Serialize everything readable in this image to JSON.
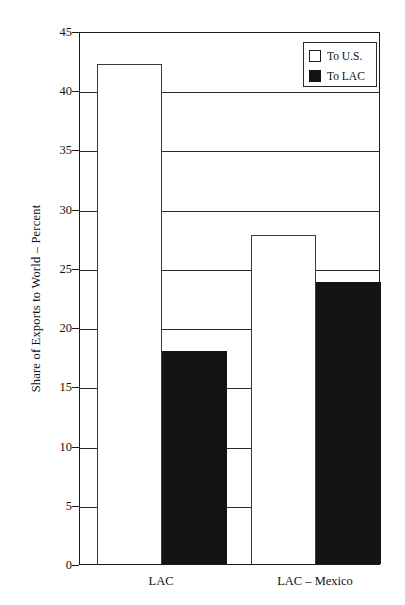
{
  "chart_data": {
    "type": "bar",
    "title": "",
    "xlabel": "",
    "ylabel": "Share of Exports to World – Percent",
    "categories": [
      "LAC",
      "LAC – Mexico"
    ],
    "series": [
      {
        "name": "To U.S.",
        "values": [
          42.2,
          27.8
        ],
        "color": "#ffffff"
      },
      {
        "name": "To LAC",
        "values": [
          18.0,
          23.8
        ],
        "color": "#141414"
      }
    ],
    "ylim": [
      0,
      45
    ],
    "ytick_step": 5,
    "yticks": [
      0,
      5,
      10,
      15,
      20,
      25,
      30,
      35,
      40,
      45
    ],
    "ytick_labels": [
      "0",
      "5",
      "10",
      "15",
      "20",
      "25",
      "30",
      "35",
      "40",
      "45"
    ],
    "grid": true,
    "grid_axis": "y",
    "legend_position": "top-right"
  },
  "axis": {
    "y_title": "Share of Exports to World – Percent"
  },
  "legend": {
    "entries": [
      {
        "label": "To U.S.",
        "swatch": "open-square-icon"
      },
      {
        "label": "To LAC",
        "swatch": "filled-square-icon"
      }
    ]
  },
  "title_remnant": ""
}
